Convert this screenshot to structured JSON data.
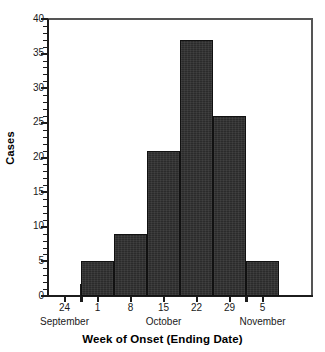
{
  "chart_data": {
    "type": "bar",
    "title": "",
    "subtitle": "",
    "xlabel": "Week of Onset (Ending Date)",
    "ylabel": "Cases",
    "categories": [
      "24",
      "1",
      "8",
      "15",
      "22",
      "29",
      "5"
    ],
    "values": [
      0,
      5,
      9,
      21,
      37,
      26,
      5
    ],
    "ylim": [
      0,
      40
    ],
    "xlim_note": "weeks ending Sep 24 through Nov 5",
    "grid": false,
    "legend": null,
    "y_ticks_major": [
      "0",
      "5",
      "10",
      "15",
      "20",
      "25",
      "30",
      "35",
      "40"
    ],
    "y_tick_minor_interval": 1,
    "bar_fill_color": "#2b2b2b",
    "bar_edge_color": "#111111",
    "axis_color": "#1c1c1c",
    "frame_color": "#555555",
    "background_color": "#ffffff",
    "month_groups": [
      {
        "label": "September",
        "weeks": [
          "24"
        ]
      },
      {
        "label": "October",
        "weeks": [
          "1",
          "8",
          "15",
          "22",
          "29"
        ]
      },
      {
        "label": "November",
        "weeks": [
          "5"
        ]
      }
    ],
    "bars": [
      {
        "week_ending": "24",
        "month": "September",
        "cases": 0
      },
      {
        "week_ending": "1",
        "month": "October",
        "cases": 5
      },
      {
        "week_ending": "8",
        "month": "October",
        "cases": 9
      },
      {
        "week_ending": "15",
        "month": "October",
        "cases": 21
      },
      {
        "week_ending": "22",
        "month": "October",
        "cases": 37
      },
      {
        "week_ending": "29",
        "month": "October",
        "cases": 26
      },
      {
        "week_ending": "5",
        "month": "November",
        "cases": 5
      }
    ]
  },
  "axes": {
    "y_title": "Cases",
    "x_title": "Week of Onset (Ending Date)"
  },
  "y_labels": {
    "t0": "0",
    "t5": "5",
    "t10": "10",
    "t15": "15",
    "t20": "20",
    "t25": "25",
    "t30": "30",
    "t35": "35",
    "t40": "40"
  },
  "x_labels": {
    "d0": "24",
    "d1": "1",
    "d2": "8",
    "d3": "15",
    "d4": "22",
    "d5": "29",
    "d6": "5"
  },
  "month_labels": {
    "m0": "September",
    "m1": "October",
    "m2": "November"
  }
}
